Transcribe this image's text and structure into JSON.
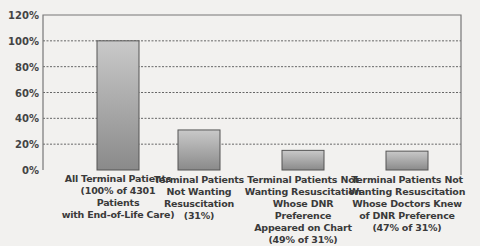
{
  "chart_data": {
    "type": "bar",
    "title": "",
    "xlabel": "",
    "ylabel": "",
    "ylim": [
      0,
      120
    ],
    "yticks": [
      0,
      20,
      40,
      60,
      80,
      100,
      120
    ],
    "ytick_labels": [
      "0%",
      "20%",
      "40%",
      "60%",
      "80%",
      "100%",
      "120%"
    ],
    "grid": true,
    "legend": "none",
    "categories": [
      "All Terminal Patients (100% of 4301 Patients with End-of-Life Care)",
      "Terminal Patients Not Wanting Resuscitation (31%)",
      "Terminal Patients Not Wanting Resuscitation Whose DNR Preference Appeared on Chart (49% of 31%)",
      "Terminal Patients Not Wanting Resuscitation Whose Doctors Knew of DNR Preference (47% of 31%)"
    ],
    "category_lines": [
      [
        "All Terminal Patients",
        "(100% of 4301 Patients",
        "with End-of-Life Care)"
      ],
      [
        "Terminal Patients",
        "Not Wanting",
        "Resuscitation",
        "(31%)"
      ],
      [
        "Terminal Patients Not",
        "Wanting Resuscitation",
        "Whose DNR Preference",
        "Appeared on Chart",
        "(49% of 31%)"
      ],
      [
        "Terminal Patients Not",
        "Wanting Resuscitation",
        "Whose Doctors Knew",
        "of DNR Preference",
        "(47% of 31%)"
      ]
    ],
    "values": [
      100,
      31,
      15.2,
      14.6
    ],
    "colors": {
      "bar_top": "#c9c9c9",
      "bar_bottom": "#8a8a8a",
      "bar_edge": "#555555",
      "grid": "#666666",
      "axis": "#777777"
    }
  }
}
